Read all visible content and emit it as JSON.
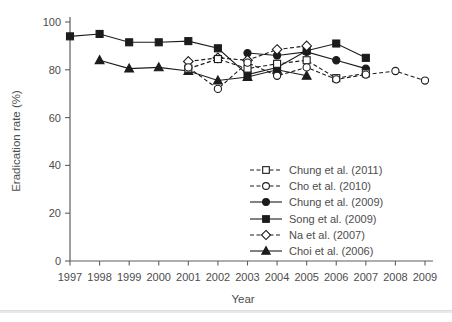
{
  "figure": {
    "width": 452,
    "height": 322,
    "background": "#ffffff"
  },
  "colors": {
    "axis": "#5f5f5f",
    "text": "#4d4d4d",
    "series": "#1c1c1c",
    "marker_open_fill": "#ffffff",
    "divider": "#e9e9e9"
  },
  "chart_data": {
    "type": "line",
    "title": "",
    "xlabel": "Year",
    "ylabel": "Eradication rate (%)",
    "xlim": [
      1996.5,
      2009.6
    ],
    "ylim": [
      0,
      100
    ],
    "x_ticks": [
      1997,
      1998,
      1999,
      2000,
      2001,
      2002,
      2003,
      2004,
      2005,
      2006,
      2007,
      2008,
      2009
    ],
    "y_ticks": [
      0,
      20,
      40,
      60,
      80,
      100
    ],
    "grid": "off",
    "legend_position": "lower right",
    "series": [
      {
        "name": "Chung et al. (2011)",
        "marker": "open-square",
        "line_style": "dashed",
        "points": [
          [
            2001,
            80.5
          ],
          [
            2002,
            84.5
          ],
          [
            2003,
            80.5
          ],
          [
            2004,
            82.5
          ],
          [
            2005,
            84
          ],
          [
            2006,
            76.5
          ],
          [
            2007,
            78.5
          ]
        ]
      },
      {
        "name": "Cho et al. (2010)",
        "marker": "open-circle",
        "line_style": "dashed",
        "points": [
          [
            2001,
            81
          ],
          [
            2002,
            72
          ],
          [
            2003,
            83
          ],
          [
            2004,
            77.5
          ],
          [
            2005,
            81
          ],
          [
            2006,
            76
          ],
          [
            2007,
            78
          ],
          [
            2008,
            79.5
          ],
          [
            2009,
            75.5
          ]
        ]
      },
      {
        "name": "Chung et al. (2009)",
        "marker": "filled-circle",
        "line_style": "solid",
        "points": [
          [
            2003,
            87
          ],
          [
            2004,
            86
          ],
          [
            2005,
            87.5
          ],
          [
            2006,
            84
          ],
          [
            2007,
            80.5
          ]
        ]
      },
      {
        "name": "Song et al. (2009)",
        "marker": "filled-square",
        "line_style": "solid",
        "points": [
          [
            1997,
            94
          ],
          [
            1998,
            95
          ],
          [
            1999,
            91.5
          ],
          [
            2000,
            91.5
          ],
          [
            2001,
            92
          ],
          [
            2002,
            89
          ],
          [
            2003,
            78
          ],
          [
            2004,
            81
          ],
          [
            2005,
            88
          ],
          [
            2006,
            91
          ],
          [
            2007,
            85
          ]
        ]
      },
      {
        "name": "Na et al. (2007)",
        "marker": "open-diamond",
        "line_style": "dashed",
        "points": [
          [
            2001,
            83.5
          ],
          [
            2002,
            85
          ],
          [
            2003,
            84
          ],
          [
            2004,
            88.5
          ],
          [
            2005,
            90
          ]
        ]
      },
      {
        "name": "Choi et al. (2006)",
        "marker": "filled-triangle",
        "line_style": "solid",
        "points": [
          [
            1998,
            84
          ],
          [
            1999,
            80.5
          ],
          [
            2000,
            81
          ],
          [
            2001,
            79.5
          ],
          [
            2002,
            75.5
          ],
          [
            2003,
            77
          ],
          [
            2004,
            80
          ],
          [
            2005,
            77.5
          ]
        ]
      }
    ]
  }
}
